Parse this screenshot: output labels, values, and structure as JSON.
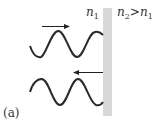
{
  "diagram": {
    "panel_label": "(a)",
    "medium_left": {
      "symbol": "n",
      "subscript": "1"
    },
    "medium_right": {
      "symbol": "n",
      "subscript": "2",
      "relation": ">",
      "compare_symbol": "n",
      "compare_subscript": "1"
    },
    "incident_wave": {
      "direction": "right",
      "label": "incident"
    },
    "reflected_wave": {
      "direction": "left",
      "label": "reflected"
    },
    "colors": {
      "wave": "#2a2a2a",
      "interface": "#d8d8d8",
      "arrow": "#222222"
    }
  }
}
